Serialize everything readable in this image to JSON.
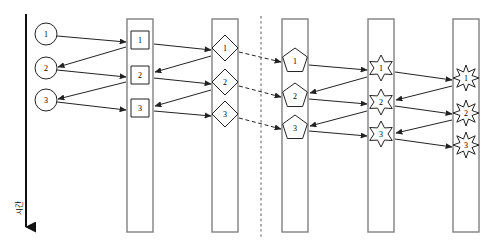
{
  "diagram": {
    "type": "node-link-stage",
    "width": 493,
    "height": 251,
    "background": "#ffffff",
    "stroke_color": "#222222",
    "node_fill": "#ffffff",
    "column_border_color": "#808080",
    "label_color": "#000000"
  },
  "time_axis": {
    "name": "time-axis",
    "label": "시간",
    "orientation": "vertical-down",
    "x": 26,
    "y_start": 14,
    "y_end": 238,
    "label_x": 22,
    "label_y": 208,
    "arrow": "down",
    "line_width": 2
  },
  "divider": {
    "name": "dashed-divider",
    "x": 261,
    "y_start": 16,
    "y_end": 237,
    "style": "dashed",
    "color": "#666666"
  },
  "columns": [
    {
      "id": "col-squares",
      "name": "column-squares",
      "x": 127,
      "y": 19,
      "width": 26,
      "height": 213,
      "shape": "square"
    },
    {
      "id": "col-diamonds",
      "name": "column-diamonds",
      "x": 212,
      "y": 19,
      "width": 26,
      "height": 213,
      "shape": "diamond"
    },
    {
      "id": "col-pentagons",
      "name": "column-pentagons",
      "x": 282,
      "y": 19,
      "width": 26,
      "height": 213,
      "shape": "pentagon"
    },
    {
      "id": "col-stars6",
      "name": "column-stars-six",
      "x": 368,
      "y": 19,
      "width": 26,
      "height": 213,
      "shape": "star6"
    },
    {
      "id": "col-stars8",
      "name": "column-stars-eight",
      "x": 453,
      "y": 19,
      "width": 26,
      "height": 213,
      "shape": "star8"
    }
  ],
  "nodes": {
    "circles": [
      {
        "name": "circle-node-1",
        "label": "1",
        "cx": 46,
        "cy": 34,
        "r": 11
      },
      {
        "name": "circle-node-2",
        "label": "2",
        "cx": 46,
        "cy": 68,
        "r": 11
      },
      {
        "name": "circle-node-3",
        "label": "3",
        "cx": 46,
        "cy": 100,
        "r": 11
      }
    ],
    "squares": [
      {
        "name": "square-node-1",
        "label": "1",
        "cx": 140,
        "cy": 40,
        "size": 18
      },
      {
        "name": "square-node-2",
        "label": "2",
        "cx": 140,
        "cy": 75,
        "size": 18
      },
      {
        "name": "square-node-3",
        "label": "3",
        "cx": 140,
        "cy": 108,
        "size": 18
      }
    ],
    "diamonds": [
      {
        "name": "diamond-node-1",
        "label": "1",
        "cx": 225,
        "cy": 48,
        "r": 13
      },
      {
        "name": "diamond-node-2",
        "label": "2",
        "cx": 225,
        "cy": 82,
        "r": 13
      },
      {
        "name": "diamond-node-3",
        "label": "3",
        "cx": 225,
        "cy": 114,
        "r": 13
      }
    ],
    "pentagons": [
      {
        "name": "pentagon-node-1",
        "label": "1",
        "cx": 295,
        "cy": 61,
        "r": 13
      },
      {
        "name": "pentagon-node-2",
        "label": "2",
        "cx": 295,
        "cy": 96,
        "r": 13
      },
      {
        "name": "pentagon-node-3",
        "label": "3",
        "cx": 295,
        "cy": 128,
        "r": 13
      }
    ],
    "stars6": [
      {
        "name": "star6-node-1",
        "label": "1",
        "cx": 381,
        "cy": 68,
        "r": 13
      },
      {
        "name": "star6-node-2",
        "label": "2",
        "cx": 381,
        "cy": 102,
        "r": 13
      },
      {
        "name": "star6-node-3",
        "label": "3",
        "cx": 381,
        "cy": 134,
        "r": 13
      }
    ],
    "stars8": [
      {
        "name": "star8-node-1",
        "label": "1",
        "cx": 466,
        "cy": 78,
        "r": 13
      },
      {
        "name": "star8-node-2",
        "label": "2",
        "cx": 466,
        "cy": 113,
        "r": 13
      },
      {
        "name": "star8-node-3",
        "label": "3",
        "cx": 466,
        "cy": 145,
        "r": 13
      }
    ]
  },
  "edges": [
    {
      "name": "edge-circle1-to-square1",
      "from": [
        57,
        36
      ],
      "to": [
        126,
        42
      ],
      "dashed": false
    },
    {
      "name": "edge-square1-to-circle2",
      "from": [
        126,
        47
      ],
      "to": [
        58,
        67
      ],
      "dashed": false
    },
    {
      "name": "edge-circle2-to-square2",
      "from": [
        57,
        70
      ],
      "to": [
        126,
        77
      ],
      "dashed": false
    },
    {
      "name": "edge-square2-to-circle3",
      "from": [
        126,
        82
      ],
      "to": [
        58,
        99
      ],
      "dashed": false
    },
    {
      "name": "edge-circle3-to-square3",
      "from": [
        57,
        102
      ],
      "to": [
        126,
        110
      ],
      "dashed": false
    },
    {
      "name": "edge-square1-to-diamond1",
      "from": [
        154,
        44
      ],
      "to": [
        211,
        50
      ],
      "dashed": false
    },
    {
      "name": "edge-diamond1-to-square2",
      "from": [
        211,
        56
      ],
      "to": [
        155,
        72
      ],
      "dashed": false
    },
    {
      "name": "edge-square2-to-diamond2",
      "from": [
        154,
        78
      ],
      "to": [
        211,
        84
      ],
      "dashed": false
    },
    {
      "name": "edge-diamond2-to-square3",
      "from": [
        211,
        90
      ],
      "to": [
        155,
        106
      ],
      "dashed": false
    },
    {
      "name": "edge-square3-to-diamond3",
      "from": [
        154,
        111
      ],
      "to": [
        211,
        116
      ],
      "dashed": false
    },
    {
      "name": "edge-diamond1-to-pentagon1",
      "from": [
        239,
        52
      ],
      "to": [
        281,
        62
      ],
      "dashed": true
    },
    {
      "name": "edge-diamond2-to-pentagon2",
      "from": [
        239,
        86
      ],
      "to": [
        281,
        97
      ],
      "dashed": true
    },
    {
      "name": "edge-diamond3-to-pentagon3",
      "from": [
        239,
        118
      ],
      "to": [
        281,
        129
      ],
      "dashed": true
    },
    {
      "name": "edge-pentagon1-to-star6-1",
      "from": [
        309,
        65
      ],
      "to": [
        367,
        70
      ],
      "dashed": false
    },
    {
      "name": "edge-star6-1-to-pentagon2",
      "from": [
        367,
        77
      ],
      "to": [
        310,
        93
      ],
      "dashed": false
    },
    {
      "name": "edge-pentagon2-to-star6-2",
      "from": [
        309,
        99
      ],
      "to": [
        367,
        104
      ],
      "dashed": false
    },
    {
      "name": "edge-star6-2-to-pentagon3",
      "from": [
        367,
        111
      ],
      "to": [
        310,
        126
      ],
      "dashed": false
    },
    {
      "name": "edge-pentagon3-to-star6-3",
      "from": [
        309,
        131
      ],
      "to": [
        367,
        136
      ],
      "dashed": false
    },
    {
      "name": "edge-star6-1-to-star8-1",
      "from": [
        395,
        72
      ],
      "to": [
        452,
        80
      ],
      "dashed": false
    },
    {
      "name": "edge-star8-1-to-star6-2",
      "from": [
        452,
        86
      ],
      "to": [
        396,
        100
      ],
      "dashed": false
    },
    {
      "name": "edge-star6-2-to-star8-2",
      "from": [
        395,
        106
      ],
      "to": [
        452,
        114
      ],
      "dashed": false
    },
    {
      "name": "edge-star8-2-to-star6-3",
      "from": [
        452,
        120
      ],
      "to": [
        396,
        133
      ],
      "dashed": false
    },
    {
      "name": "edge-star6-3-to-star8-3",
      "from": [
        395,
        139
      ],
      "to": [
        452,
        147
      ],
      "dashed": false
    }
  ]
}
